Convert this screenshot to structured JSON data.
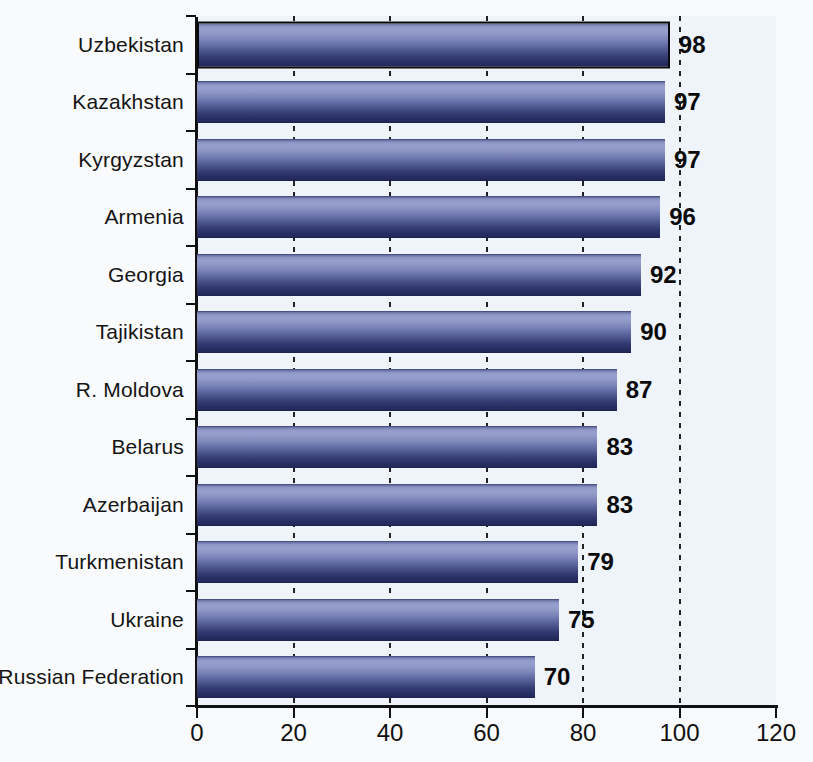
{
  "chart_data": {
    "type": "bar",
    "orientation": "horizontal",
    "title": "",
    "xlabel": "",
    "ylabel": "",
    "categories": [
      "Uzbekistan",
      "Kazakhstan",
      "Kyrgyzstan",
      "Armenia",
      "Georgia",
      "Tajikistan",
      "R. Moldova",
      "Belarus",
      "Azerbaijan",
      "Turkmenistan",
      "Ukraine",
      "Russian Federation"
    ],
    "values": [
      98,
      97,
      97,
      96,
      92,
      90,
      87,
      83,
      83,
      79,
      75,
      70
    ],
    "xlim": [
      0,
      120
    ],
    "xticks": [
      0,
      20,
      40,
      60,
      80,
      100,
      120
    ],
    "grid": "dashed vertical gridlines at 20,40,60,80,100 drawn behind bars",
    "legend": "none",
    "value_labels": "bold, right of each bar end",
    "colors": {
      "bar_light": "#97a0cd",
      "bar_dark": "#222959",
      "first_bar_border": "#0a0a0a",
      "axis": "#111111",
      "gridline": "#222222",
      "text": "#111111",
      "plot_background": "#eff4fa",
      "page_background": "#f8fafc"
    }
  }
}
